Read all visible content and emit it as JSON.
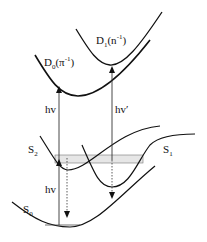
{
  "diagram": {
    "states": [
      {
        "id": "D1",
        "main": "D",
        "sub": "1",
        "paren": "(n",
        "sup": "-1",
        "close": ")"
      },
      {
        "id": "D0",
        "main": "D",
        "sub": "0",
        "paren": "(π",
        "sup": "-1",
        "close": ")"
      },
      {
        "id": "S2",
        "main": "S",
        "sub": "2"
      },
      {
        "id": "S1",
        "main": "S",
        "sub": "1"
      },
      {
        "id": "S0",
        "main": "S",
        "sub": "0"
      }
    ],
    "transitions": [
      {
        "id": "hv-ionization",
        "label": "hv"
      },
      {
        "id": "hv-prime-ionization",
        "label": "hv′"
      },
      {
        "id": "hv-excitation",
        "label": "hv"
      }
    ],
    "colors": {
      "curve": "#111111",
      "arrow": "#333333",
      "band": "#e6e6e6"
    }
  }
}
